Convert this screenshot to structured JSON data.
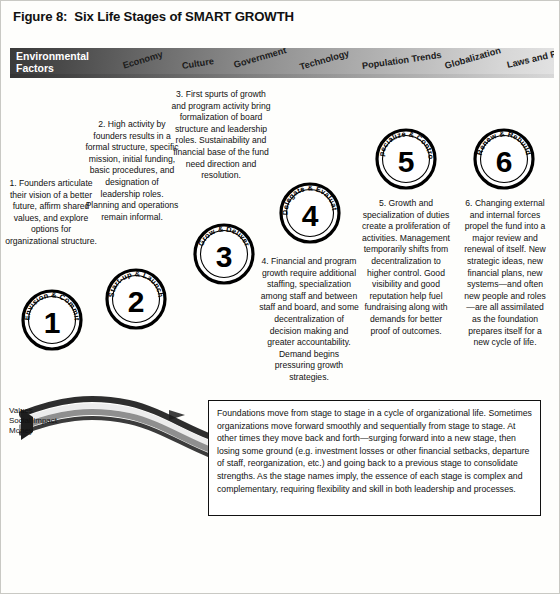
{
  "figure": {
    "title": "Figure 8:  Six Life Stages of SMART GROWTH"
  },
  "environmental_bar": {
    "label": "Environmental\nFactors",
    "factors": [
      {
        "name": "Economy"
      },
      {
        "name": "Culture"
      },
      {
        "name": "Government"
      },
      {
        "name": "Technology"
      },
      {
        "name": "Population Trends"
      },
      {
        "name": "Globalization"
      },
      {
        "name": "Laws and Policy"
      }
    ],
    "gradient_from": "#3a3a3a",
    "gradient_to": "#e2e2e2"
  },
  "stages": [
    {
      "number": "1",
      "ring_label": "Envision & Commit",
      "text": "1. Founders articulate their vision of a better future, affirm shared values, and explore options for organizational structure."
    },
    {
      "number": "2",
      "ring_label": "Start-up & Launch",
      "text": "2. High activity by founders results in a formal structure, specific mission, initial funding, basic procedures, and designation of leadership roles. Planning and operations remain informal."
    },
    {
      "number": "3",
      "ring_label": "Grow & Deliver",
      "text": "3. First spurts of growth and program activity bring formalization of board structure and leadership roles. Sustainability and financial base of the fund need direction and resolution."
    },
    {
      "number": "4",
      "ring_label": "Delegate & Evaluate",
      "text": "4. Financial and program growth require additional staffing, specialization among staff and between staff and board, and some decentralization of decision making and greater accountability. Demand begins pressuring growth strategies."
    },
    {
      "number": "5",
      "ring_label": "Specialize & Control",
      "text": "5. Growth and specialization of duties create a proliferation of activities. Management temporarily shifts from decentralization to higher control. Good visibility and good reputation help fuel fundraising along with demands for better proof of outcomes."
    },
    {
      "number": "6",
      "ring_label": "Renew & Rebuild",
      "text": "6. Changing external and internal forces propel the fund into a major review and renewal of itself. New strategic ideas, new financial plans, new systems—and often new people and roles—are all assimilated as the foundation prepares itself for a new cycle of life."
    }
  ],
  "ribbon": {
    "legend": "Values\nSocial Impact\nMoney",
    "band_colors": [
      "#2f2f2f",
      "#e9e9e9",
      "#8c8c8c"
    ]
  },
  "caption": {
    "text": "Foundations move from stage to stage in a cycle of organizational life. Sometimes organizations move forward smoothly and sequentially from stage to stage. At other times they move back and forth—surging forward into a new stage, then losing some ground (e.g. investment losses or other financial setbacks, departure of staff, reorganization, etc.) and going back to a previous stage to consolidate strengths. As the stage names imply, the essence of each stage is complex and complementary, requiring flexibility and skill in both leadership and processes."
  }
}
